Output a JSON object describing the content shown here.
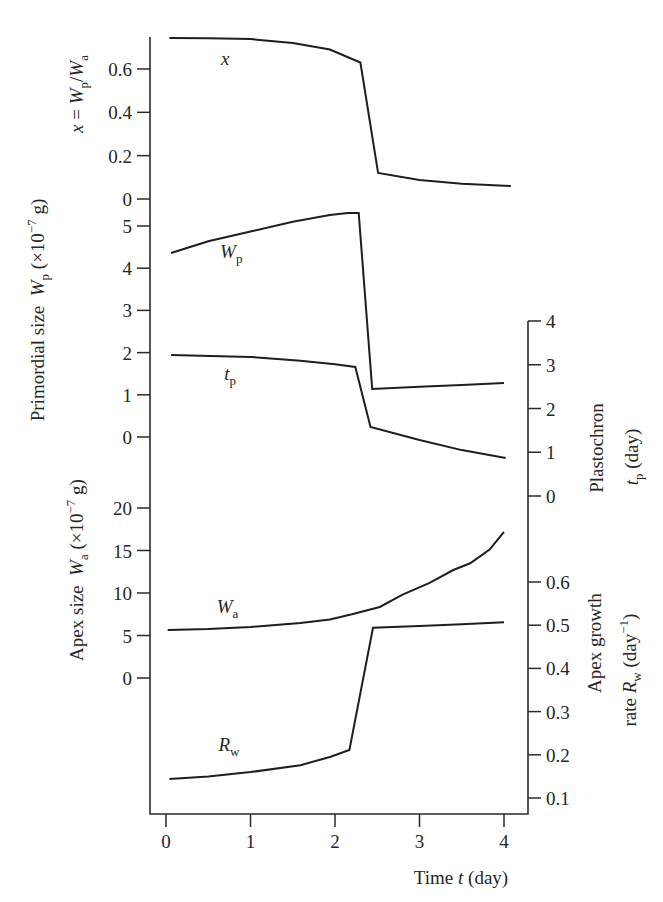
{
  "chart_data": {
    "type": "line",
    "title": "",
    "grid": false,
    "legend": "none (curves labeled inline)",
    "xlim": [
      0,
      4.1
    ],
    "xlabel_text": "Time t (day)",
    "xlabel": [
      {
        "t": "Time "
      },
      {
        "t": "t",
        "s": "i"
      },
      {
        "t": " (day)"
      }
    ],
    "x_ticks": [
      {
        "v": 0,
        "label": "0"
      },
      {
        "v": 1,
        "label": "1"
      },
      {
        "v": 2,
        "label": "2"
      },
      {
        "v": 3,
        "label": "3"
      },
      {
        "v": 4,
        "label": "4"
      }
    ],
    "axes": {
      "left": [
        {
          "id": "ratio",
          "label_text": "x = Wp/Wa",
          "label": [
            [
              {
                "t": "x",
                "s": "i"
              },
              {
                "t": " = "
              },
              {
                "t": "W",
                "s": "i"
              },
              {
                "t": "p",
                "s": "sub"
              },
              {
                "t": "/"
              },
              {
                "t": "W",
                "s": "i"
              },
              {
                "t": "a",
                "s": "sub"
              }
            ]
          ],
          "ylim": [
            0,
            0.75
          ],
          "ticks": [
            {
              "v": 0.6,
              "label": "0.6"
            },
            {
              "v": 0.4,
              "label": "0.4"
            },
            {
              "v": 0.2,
              "label": "0.2"
            },
            {
              "v": 0,
              "label": "0"
            }
          ]
        },
        {
          "id": "wp",
          "label_text": "Primordial size Wp (×10^-7 g)",
          "label": [
            [
              {
                "t": "Primordial size  "
              },
              {
                "t": "W",
                "s": "i"
              },
              {
                "t": "p",
                "s": "sub"
              },
              {
                "t": " (×10"
              },
              {
                "t": "−7",
                "s": "sup"
              },
              {
                "t": " g)"
              }
            ]
          ],
          "ylim": [
            0,
            5.5
          ],
          "ticks": [
            {
              "v": 5,
              "label": "5"
            },
            {
              "v": 4,
              "label": "4"
            },
            {
              "v": 3,
              "label": "3"
            },
            {
              "v": 2,
              "label": "2"
            },
            {
              "v": 1,
              "label": "1"
            },
            {
              "v": 0,
              "label": "0"
            }
          ]
        },
        {
          "id": "wa",
          "label_text": "Apex size Wa (×10^-7 g)",
          "label": [
            [
              {
                "t": "Apex size  "
              },
              {
                "t": "W",
                "s": "i"
              },
              {
                "t": "a",
                "s": "sub"
              },
              {
                "t": " (×10"
              },
              {
                "t": "−7",
                "s": "sup"
              },
              {
                "t": " g)"
              }
            ]
          ],
          "ylim": [
            0,
            20
          ],
          "ticks": [
            {
              "v": 20,
              "label": "20"
            },
            {
              "v": 15,
              "label": "15"
            },
            {
              "v": 10,
              "label": "10"
            },
            {
              "v": 5,
              "label": "5"
            },
            {
              "v": 0,
              "label": "0"
            }
          ]
        }
      ],
      "right": [
        {
          "id": "tp",
          "label_text": "Plastochron tp (day)",
          "label": [
            [
              {
                "t": "Plastochron"
              }
            ],
            [
              {
                "t": "t",
                "s": "i"
              },
              {
                "t": "p",
                "s": "sub"
              },
              {
                "t": " (day)"
              }
            ]
          ],
          "ylim": [
            0,
            4
          ],
          "ticks": [
            {
              "v": 4,
              "label": "4"
            },
            {
              "v": 3,
              "label": "3"
            },
            {
              "v": 2,
              "label": "2"
            },
            {
              "v": 1,
              "label": "1"
            },
            {
              "v": 0,
              "label": "0"
            }
          ]
        },
        {
          "id": "rw",
          "label_text": "Apex growth rate Rw (day^-1)",
          "label": [
            [
              {
                "t": "Apex growth"
              }
            ],
            [
              {
                "t": "rate "
              },
              {
                "t": "R",
                "s": "i"
              },
              {
                "t": "w",
                "s": "sub"
              },
              {
                "t": " (day"
              },
              {
                "t": "−1",
                "s": "sup"
              },
              {
                "t": ")"
              }
            ]
          ],
          "ylim": [
            0.1,
            0.6
          ],
          "ticks": [
            {
              "v": 0.6,
              "label": "0.6"
            },
            {
              "v": 0.5,
              "label": "0.5"
            },
            {
              "v": 0.4,
              "label": "0.4"
            },
            {
              "v": 0.3,
              "label": "0.3"
            },
            {
              "v": 0.2,
              "label": "0.2"
            },
            {
              "v": 0.1,
              "label": "0.1"
            }
          ]
        }
      ]
    },
    "series": [
      {
        "name": "x",
        "axis": "ratio",
        "label": [
          {
            "t": "x",
            "s": "i"
          }
        ],
        "label_pos": [
          0.65,
          0.62
        ],
        "points": [
          [
            0.04,
            0.743
          ],
          [
            0.5,
            0.742
          ],
          [
            1.0,
            0.738
          ],
          [
            1.5,
            0.72
          ],
          [
            1.94,
            0.69
          ],
          [
            2.3,
            0.63
          ],
          [
            2.51,
            0.12
          ],
          [
            3.0,
            0.088
          ],
          [
            3.5,
            0.07
          ],
          [
            4.08,
            0.06
          ]
        ]
      },
      {
        "name": "Wp",
        "axis": "wp",
        "label": [
          {
            "t": "W",
            "s": "i"
          },
          {
            "t": "p",
            "s": "sub"
          }
        ],
        "label_pos": [
          0.64,
          4.24
        ],
        "points": [
          [
            0.06,
            4.36
          ],
          [
            0.5,
            4.64
          ],
          [
            1.0,
            4.87
          ],
          [
            1.5,
            5.1
          ],
          [
            1.94,
            5.26
          ],
          [
            2.15,
            5.31
          ],
          [
            2.28,
            5.31
          ],
          [
            2.44,
            1.14
          ],
          [
            3.0,
            1.19
          ],
          [
            3.5,
            1.23
          ],
          [
            4.0,
            1.28
          ]
        ]
      },
      {
        "name": "tp",
        "axis": "tp",
        "label": [
          {
            "t": "t",
            "s": "i"
          },
          {
            "t": "p",
            "s": "sub"
          }
        ],
        "label_pos": [
          0.69,
          2.65
        ],
        "points": [
          [
            0.06,
            3.22
          ],
          [
            1.0,
            3.18
          ],
          [
            1.59,
            3.09
          ],
          [
            2.0,
            3.01
          ],
          [
            2.24,
            2.95
          ],
          [
            2.42,
            1.58
          ],
          [
            3.0,
            1.28
          ],
          [
            3.5,
            1.05
          ],
          [
            4.02,
            0.87
          ]
        ]
      },
      {
        "name": "Wa",
        "axis": "wa",
        "label": [
          {
            "t": "W",
            "s": "i"
          },
          {
            "t": "a",
            "s": "sub"
          }
        ],
        "label_pos": [
          0.6,
          7.65
        ],
        "points": [
          [
            0.02,
            5.65
          ],
          [
            0.5,
            5.75
          ],
          [
            1.0,
            6.0
          ],
          [
            1.59,
            6.47
          ],
          [
            1.94,
            6.9
          ],
          [
            2.2,
            7.5
          ],
          [
            2.53,
            8.35
          ],
          [
            2.8,
            9.8
          ],
          [
            3.12,
            11.2
          ],
          [
            3.4,
            12.7
          ],
          [
            3.6,
            13.5
          ],
          [
            3.83,
            15.1
          ],
          [
            4.0,
            17.2
          ]
        ]
      },
      {
        "name": "Rw",
        "axis": "rw",
        "label": [
          {
            "t": "R",
            "s": "i"
          },
          {
            "t": "w",
            "s": "sub"
          }
        ],
        "label_pos": [
          0.62,
          0.209
        ],
        "points": [
          [
            0.04,
            0.144
          ],
          [
            0.5,
            0.15
          ],
          [
            1.0,
            0.16
          ],
          [
            1.59,
            0.176
          ],
          [
            1.94,
            0.195
          ],
          [
            2.17,
            0.211
          ],
          [
            2.45,
            0.494
          ],
          [
            3.0,
            0.498
          ],
          [
            3.5,
            0.502
          ],
          [
            4.0,
            0.507
          ]
        ]
      }
    ]
  }
}
